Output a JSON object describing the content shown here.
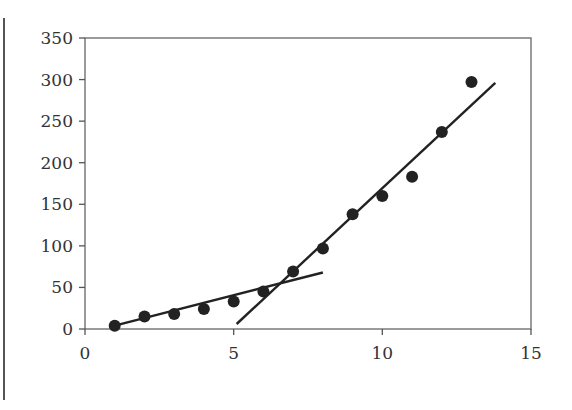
{
  "chart_data": {
    "type": "scatter",
    "title": "",
    "xlabel": "",
    "ylabel": "",
    "xlim": [
      0,
      15
    ],
    "ylim": [
      0,
      350
    ],
    "xticks": [
      0,
      5,
      10,
      15
    ],
    "yticks": [
      0,
      50,
      100,
      150,
      200,
      250,
      300,
      350
    ],
    "grid": false,
    "legend": null,
    "series": [
      {
        "name": "data",
        "kind": "scatter",
        "color": "#222222",
        "x": [
          1,
          2,
          3,
          4,
          5,
          6,
          7,
          8,
          9,
          10,
          11,
          12,
          13
        ],
        "y": [
          4,
          15,
          18,
          24,
          33,
          45,
          69,
          97,
          138,
          160,
          183,
          237,
          297
        ]
      },
      {
        "name": "trend-line-low",
        "kind": "line",
        "color": "#222222",
        "x": [
          1,
          8
        ],
        "y": [
          4,
          68
        ]
      },
      {
        "name": "trend-line-high",
        "kind": "line",
        "color": "#222222",
        "x": [
          5.1,
          13.8
        ],
        "y": [
          6,
          296
        ]
      }
    ]
  }
}
